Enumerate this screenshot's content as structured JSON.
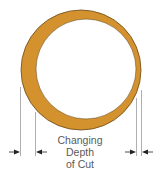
{
  "diagram": {
    "label": {
      "lines": [
        "Changing",
        "Depth",
        "of Cut"
      ]
    },
    "colors": {
      "ring_fill": "#D4922F",
      "ring_outline": "#6b4a18",
      "inner_fill": "#ffffff",
      "dimension_line": "#9a9a9a",
      "arrow": "#222222",
      "text": "#5a5a5a"
    },
    "shapes": {
      "outer_circle": {
        "cx": 81,
        "cy": 70,
        "r": 60
      },
      "inner_circle": {
        "cx": 86,
        "cy": 69,
        "r": 50
      }
    },
    "dimensions": {
      "left": {
        "thick_side": true,
        "lines_x": [
          20,
          35
        ],
        "arrow_y": 152
      },
      "right": {
        "thin_side": true,
        "lines_x": [
          136,
          141
        ],
        "arrow_y": 152
      }
    }
  }
}
